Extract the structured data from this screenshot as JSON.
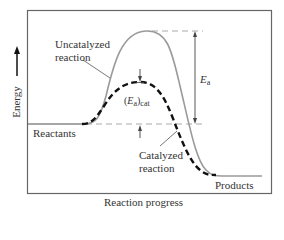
{
  "diagram": {
    "type": "energy-profile",
    "title": "",
    "colors": {
      "frame": "#555555",
      "uncatalyzed_curve": "#9a9a9a",
      "catalyzed_curve": "#111111",
      "reference_dashes": "#aaaaaa",
      "arrows": "#444444",
      "background": "#ffffff"
    },
    "axes": {
      "y_label": "Energy",
      "x_label": "Reaction progress"
    },
    "labels": {
      "uncatalyzed_line1": "Uncatalyzed",
      "uncatalyzed_line2": "reaction",
      "catalyzed_line1": "Catalyzed",
      "catalyzed_line2": "reaction",
      "reactants": "Reactants",
      "products": "Products",
      "ea_main": "E",
      "ea_sub": "a",
      "ea_cat_open": "(",
      "ea_cat_main": "E",
      "ea_cat_sub": "a",
      "ea_cat_close": ")",
      "ea_cat_subscript": "cat"
    },
    "levels": {
      "reactants_energy": "baseline",
      "products_energy": "below reactants",
      "uncatalyzed_peak": "high",
      "catalyzed_peak": "lower than uncatalyzed"
    }
  }
}
